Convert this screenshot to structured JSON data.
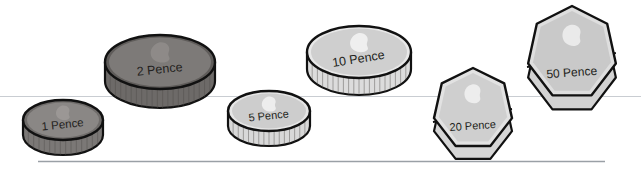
{
  "scene": {
    "title": "UK coins denomination line-up",
    "background_color": "#ffffff",
    "guide_line_color": "#c9cdd2",
    "baseline_color": "#9aa0a6",
    "outline_color": "#111111"
  },
  "guides": {
    "upper_rule_label": "faint horizontal guide line",
    "baseline_label": "page rule"
  },
  "coins": [
    {
      "id": "one-pence",
      "label": "1 Pence",
      "shape": "circle",
      "face_color": "#8a8785",
      "rim_color": "#6f6c6a",
      "edge_color": "#7b7876",
      "portrait_color": "#9d9a98",
      "label_color": "#231f20",
      "label_font_size": "11.5",
      "label_rotation": "-6",
      "cx": "63",
      "cy": "120",
      "rx": "40",
      "ry": "20",
      "thickness": "15",
      "milled": "true"
    },
    {
      "id": "two-pence",
      "label": "2 Pence",
      "shape": "circle",
      "face_color": "#7d7a78",
      "rim_color": "#5f5c5a",
      "edge_color": "#6d6a68",
      "portrait_color": "#908d8b",
      "label_color": "#1b1817",
      "label_font_size": "12.5",
      "label_rotation": "-6",
      "cx": "160",
      "cy": "62",
      "rx": "55",
      "ry": "27",
      "thickness": "19",
      "milled": "true"
    },
    {
      "id": "five-pence",
      "label": "5 Pence",
      "shape": "circle",
      "face_color": "#cdcdcd",
      "rim_color": "#e6e6e6",
      "edge_color": "#d8d8d8",
      "portrait_color": "#f2f2f2",
      "label_color": "#231f20",
      "label_font_size": "11",
      "label_rotation": "-6",
      "cx": "269",
      "cy": "111",
      "rx": "41",
      "ry": "20",
      "thickness": "15",
      "milled": "true"
    },
    {
      "id": "ten-pence",
      "label": "10 Pence",
      "shape": "circle",
      "face_color": "#cfcfcf",
      "rim_color": "#e8e8e8",
      "edge_color": "#dcdcdc",
      "portrait_color": "#f4f4f4",
      "label_color": "#231f20",
      "label_font_size": "12.5",
      "label_rotation": "-9",
      "cx": "359",
      "cy": "52",
      "rx": "52",
      "ry": "26",
      "thickness": "17",
      "milled": "true"
    },
    {
      "id": "twenty-pence",
      "label": "20 Pence",
      "shape": "heptagon",
      "face_color": "#cfcfcf",
      "rim_color": "#e2e2e2",
      "edge_color": "#d6d6d6",
      "portrait_color": "#efefef",
      "label_color": "#231f20",
      "label_font_size": "11",
      "label_rotation": "-4",
      "cx": "473",
      "cy": "109",
      "rx": "40",
      "ry": "41",
      "thickness": "13",
      "milled": "false"
    },
    {
      "id": "fifty-pence",
      "label": "50 Pence",
      "shape": "heptagon",
      "face_color": "#c9c9c9",
      "rim_color": "#dedede",
      "edge_color": "#d2d2d2",
      "portrait_color": "#ededed",
      "label_color": "#231f20",
      "label_font_size": "12",
      "label_rotation": "-4",
      "cx": "572",
      "cy": "53",
      "rx": "45",
      "ry": "47",
      "thickness": "14",
      "milled": "false"
    }
  ]
}
